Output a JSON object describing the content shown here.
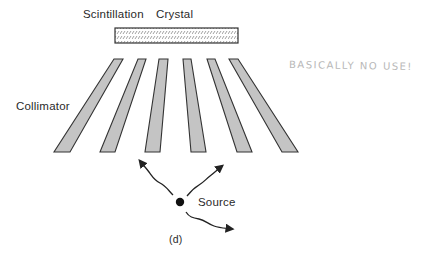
{
  "labels": {
    "crystal_left": "Scintillation",
    "crystal_right": "Crystal",
    "collimator": "Collimator",
    "source": "Source",
    "caption": "(d)"
  },
  "annotation": {
    "handwritten_note": "BASICALLY NO USE!"
  },
  "colors": {
    "strip_fill": "#c4c4c4",
    "outline": "#333333",
    "note": "#b8b8b8"
  },
  "collimator_strips": [
    {
      "top": [
        114,
        123
      ],
      "bottom": [
        54,
        70
      ]
    },
    {
      "top": [
        138,
        146
      ],
      "bottom": [
        100,
        115
      ]
    },
    {
      "top": [
        159,
        168
      ],
      "bottom": [
        145,
        160
      ]
    },
    {
      "top": [
        183,
        191
      ],
      "bottom": [
        191,
        206
      ]
    },
    {
      "top": [
        207,
        215
      ],
      "bottom": [
        237,
        252
      ]
    },
    {
      "top": [
        229,
        238
      ],
      "bottom": [
        282,
        298
      ]
    }
  ]
}
